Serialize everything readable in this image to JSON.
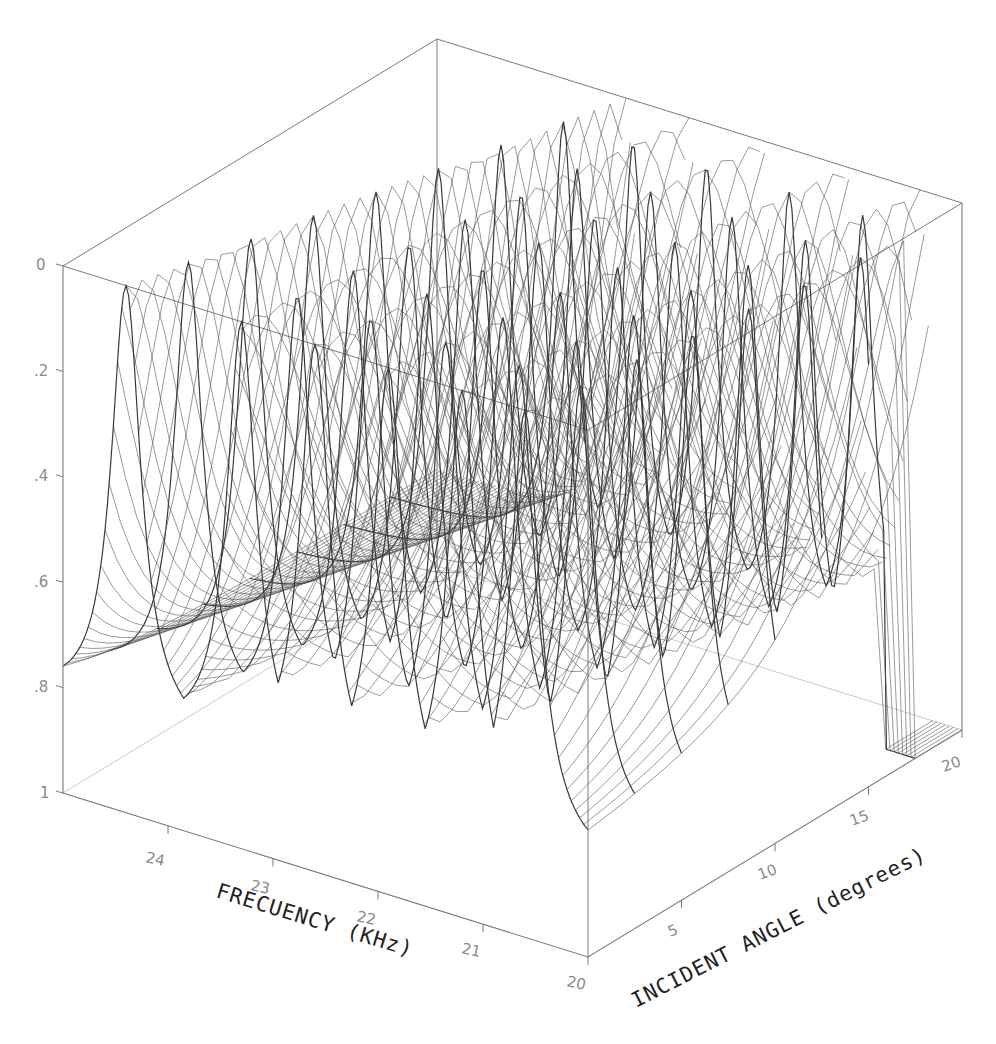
{
  "chart_data": {
    "type": "surface3d",
    "title": "",
    "xlabel": "FREQUENCY (KHz)",
    "ylabel": "INCIDENT ANGLE (degrees)",
    "zlabel": "",
    "x_ticks": [
      "24",
      "23",
      "22",
      "21",
      "20"
    ],
    "x_tick_values": [
      24,
      23,
      22,
      21,
      20
    ],
    "x_range": [
      25,
      20
    ],
    "y_ticks": [
      "5",
      "10",
      "15",
      "20"
    ],
    "y_tick_values": [
      5,
      10,
      15,
      20
    ],
    "y_range": [
      0,
      20
    ],
    "z_ticks": [
      "0",
      ".2",
      ".4",
      ".6",
      ".8",
      "1"
    ],
    "z_tick_values": [
      0,
      0.2,
      0.4,
      0.6,
      0.8,
      1
    ],
    "z_range": [
      0,
      1
    ],
    "z_axis_inverted": true,
    "grid": false,
    "legend": null,
    "ridges": [
      {
        "freq_at_0deg": 24.4,
        "freq_at_20deg": 23.2,
        "min_depth": 0.78
      },
      {
        "freq_at_0deg": 23.3,
        "freq_at_20deg": 22.6,
        "min_depth": 0.8
      },
      {
        "freq_at_0deg": 22.6,
        "freq_at_20deg": 21.9,
        "min_depth": 0.8
      },
      {
        "freq_at_0deg": 21.9,
        "freq_at_20deg": 21.1,
        "min_depth": 0.8
      },
      {
        "freq_at_0deg": 21.2,
        "freq_at_20deg": 20.4,
        "min_depth": 0.8
      },
      {
        "freq_at_0deg": 20.6,
        "freq_at_20deg": 19.9,
        "min_depth": 0.8
      }
    ]
  },
  "labels": {
    "x_title": "FRECUENCY (KHz)",
    "y_title": "INCIDENT ANGLE (degrees)",
    "z_ticks": [
      "0",
      ".2",
      ".4",
      ".6",
      ".8",
      "1"
    ],
    "x_ticks": [
      "24",
      "23",
      "22",
      "21",
      "20"
    ],
    "y_ticks": [
      "5",
      "10",
      "15",
      "20"
    ]
  },
  "style": {
    "line_color": "#3a3a3a",
    "box_color": "#7a7a7a",
    "background": "#ffffff"
  }
}
